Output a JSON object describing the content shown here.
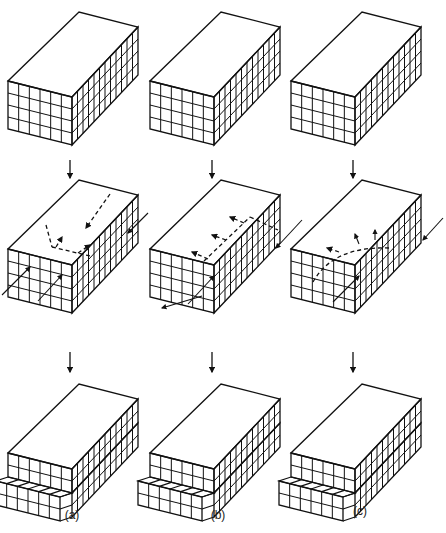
{
  "figure": {
    "columns": [
      {
        "id": "a",
        "label": "(a)",
        "x": 0,
        "type": "edge dislocation",
        "stage2_note": "edge dislocation, glide across slip plane"
      },
      {
        "id": "b",
        "label": "(b)",
        "x": 142,
        "type": "screw dislocation",
        "stage2_note": "screw dislocation, glide across slip plane"
      },
      {
        "id": "c",
        "label": "(c)",
        "x": 283,
        "type": "mixed dislocation loop",
        "stage2_note": "curved dislocation loop expanding"
      }
    ],
    "rows": [
      {
        "stage": "initial",
        "y": 0
      },
      {
        "stage": "dislocation moving",
        "y": 158
      },
      {
        "stage": "slipped",
        "y": 352
      }
    ],
    "grid": {
      "front_cols": 6,
      "rows": 4,
      "side_cols": 12
    },
    "stroke_color": "#111111",
    "background": "#ffffff"
  }
}
